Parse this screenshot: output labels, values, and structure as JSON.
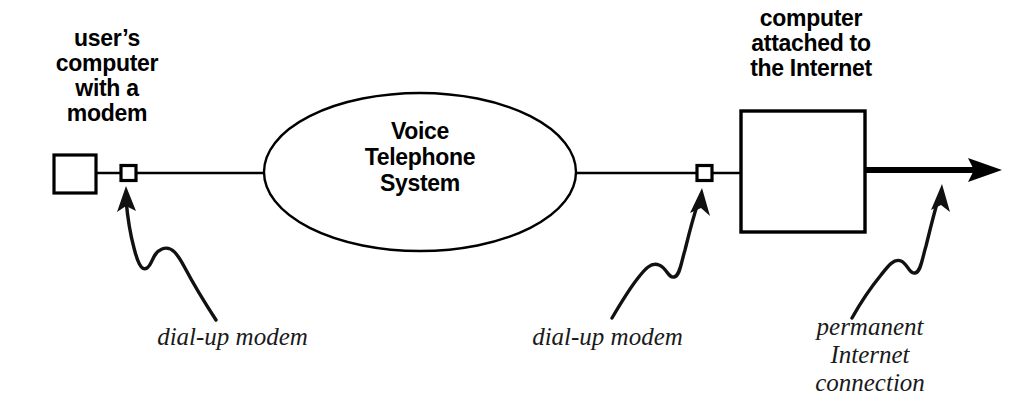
{
  "diagram": {
    "background_color": "#ffffff",
    "stroke_color": "#000000",
    "nodes": {
      "user_computer": {
        "caption": "user’s\ncomputer\nwith a\nmodem",
        "shape": "square"
      },
      "voice_network": {
        "caption": "Voice\nTelephone\nSystem",
        "shape": "ellipse"
      },
      "internet_computer": {
        "caption": "computer\nattached to\nthe Internet",
        "shape": "square"
      }
    },
    "callouts": {
      "left_modem": "dial-up modem",
      "right_modem": "dial-up modem",
      "permanent_link": "permanent\nInternet\nconnection"
    },
    "icons": {
      "user_computer": "computer-box-icon",
      "left_modem": "modem-square-icon",
      "voice_network": "ellipse-cloud-icon",
      "right_modem": "modem-square-icon",
      "internet_computer": "computer-box-icon",
      "permanent_link": "thick-arrow-icon",
      "callout_left": "squiggly-arrow-icon",
      "callout_middle": "squiggly-arrow-icon",
      "callout_right": "squiggly-arrow-icon"
    }
  }
}
